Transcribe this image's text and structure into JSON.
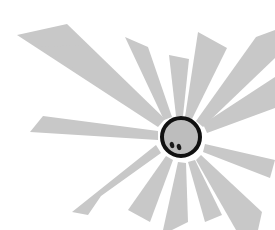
{
  "illustration": {
    "subject": "sun with radiating rays",
    "colors": {
      "background": "#ffffff",
      "ray_fill": "#c8c8c8",
      "sun_fill": "#bdbdbd",
      "sun_outline": "#111111",
      "eyes": "#1a1a1a"
    },
    "sun": {
      "cx": 181,
      "cy": 137,
      "r": 19,
      "stroke_width": 4
    },
    "eyes": [
      {
        "cx": 172,
        "cy": 145,
        "rx": 2.2,
        "ry": 3.2
      },
      {
        "cx": 179,
        "cy": 147,
        "rx": 2.2,
        "ry": 3.2
      }
    ],
    "rays": [
      {
        "points": "17,35 67,24 165,119 158,127"
      },
      {
        "points": "125,37 148,47 172,117 164,120"
      },
      {
        "points": "169,55 189,59 183,116 176,116"
      },
      {
        "points": "198,32 227,48 192,119 185,117"
      },
      {
        "points": "256,37 275,30 275,58 203,127 196,121"
      },
      {
        "points": "275,77 275,108 207,133 203,124"
      },
      {
        "points": "205,144 275,160 270,178 203,152"
      },
      {
        "points": "201,155 262,212 258,230 236,230 196,160"
      },
      {
        "points": "195,160 222,215 205,222 188,162"
      },
      {
        "points": "186,163 188,222 172,230 163,230 178,162"
      },
      {
        "points": "173,160 150,222 128,210 166,156"
      },
      {
        "points": "161,153 101,196 88,215 72,212 156,145"
      },
      {
        "points": "158,140 30,132 43,116 158,131"
      },
      {
        "points": "160,124 41,47 83,45 163,118"
      }
    ]
  }
}
